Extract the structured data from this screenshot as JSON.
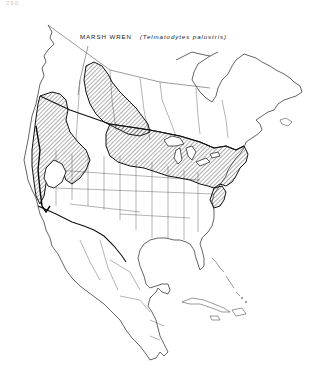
{
  "page": {
    "page_number": "290"
  },
  "map": {
    "title_common": "MARSH WREN",
    "title_scientific": "(Telmatodytes palustris)",
    "region": "North and Central America",
    "legend": {
      "hatched_area": "breeding range",
      "bold_line": "winter range boundary"
    },
    "colors": {
      "ink": "#1a1a1a",
      "background": "#ffffff",
      "hatch": "#333333"
    }
  }
}
